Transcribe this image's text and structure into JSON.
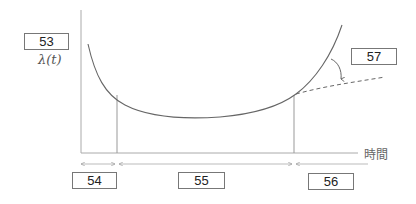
{
  "diagram": {
    "type": "bathtub-curve",
    "y_axis_label": "λ(t)",
    "x_axis_label": "時間",
    "boxes": {
      "y_axis_box": "53",
      "early_period": "54",
      "random_period": "55",
      "wearout_period": "56",
      "improvement_arrow": "57"
    },
    "colors": {
      "axis": "#aaaaaa",
      "curve": "#666666",
      "box_border": "#777777"
    }
  }
}
